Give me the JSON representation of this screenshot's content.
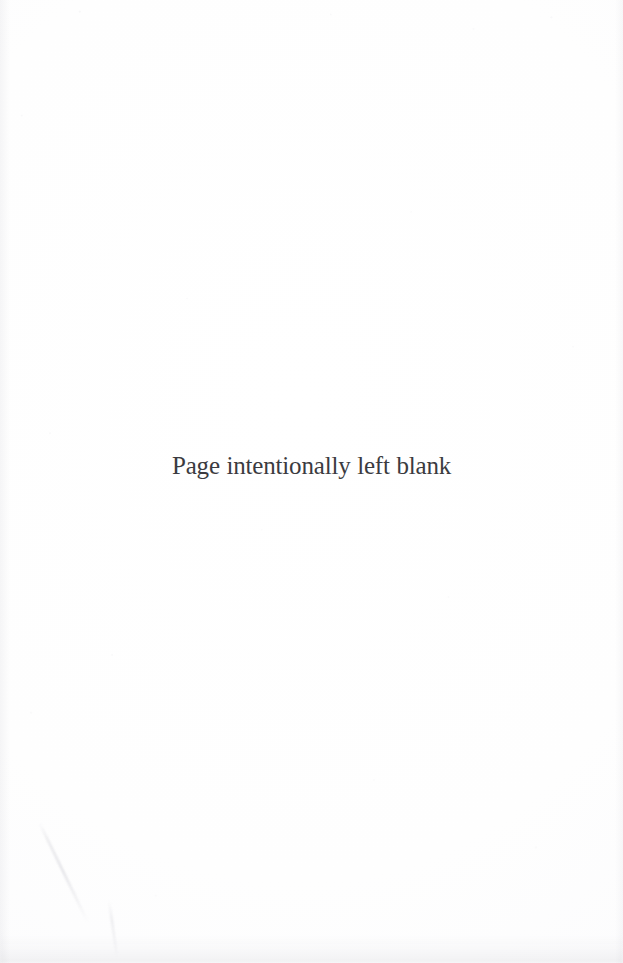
{
  "page": {
    "kind": "scanned-book-page",
    "width": 623,
    "height": 963,
    "paper_color": "#fefefe",
    "text_color": "#3b3b40"
  },
  "content": {
    "notice": "Page intentionally left blank"
  },
  "artifacts": {
    "crease_label": "diagonal scan crease",
    "smudge_label": "bottom edge smudge",
    "grain_label": "paper grain speckle"
  }
}
